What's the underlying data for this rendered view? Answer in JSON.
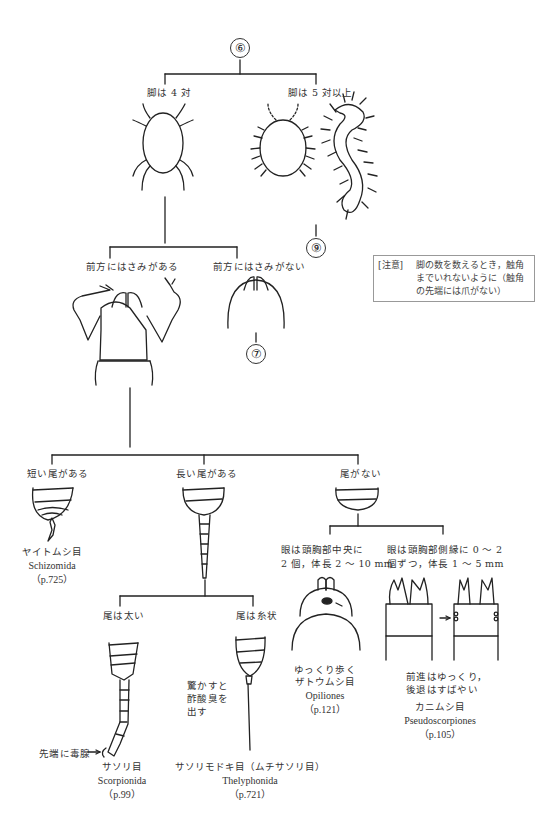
{
  "nodes": {
    "start": "⑥",
    "goto_7": "⑦",
    "goto_9": "⑨"
  },
  "legs": {
    "four_pairs": "脚は 4 対",
    "five_plus_pairs": "脚は 5 対以上"
  },
  "note": {
    "tag": "[注意]",
    "text": "脚の数を数えるとき，触角までいれないように（触角の先端には爪がない）"
  },
  "front": {
    "with_pincers": "前方にはさみがある",
    "without_pincers": "前方にはさみがない"
  },
  "tail": {
    "short": "短い尾がある",
    "long": "長い尾がある",
    "none": "尾がない",
    "thick": "尾は太い",
    "threadlike": "尾は糸状"
  },
  "eyes": {
    "center_line1": "眼は頭胸部中央に",
    "center_line2": "2 個，体長 2 〜 10 mm",
    "side_line1": "眼は頭胸部側縁に 0 〜 2",
    "side_line2": "個ずつ，体長 1 〜 5 mm"
  },
  "annotations": {
    "stinger": "先端に毒腺",
    "vinegar_line1": "驚かすと",
    "vinegar_line2": "酢酸臭を",
    "vinegar_line3": "出す",
    "slow_walk": "ゆっくり歩く",
    "pseudo_line1": "前進はゆっくり，",
    "pseudo_line2": "後退はすばやい"
  },
  "taxa": [
    {
      "jp": "ヤイトムシ目",
      "sci": "Schizomida",
      "page": "（p.725）"
    },
    {
      "jp": "サソリ目",
      "sci": "Scorpionida",
      "page": "（p.99）"
    },
    {
      "jp": "サソリモドキ目（ムチサソリ目）",
      "sci": "Thelyphonida",
      "page": "（p.721）"
    },
    {
      "jp": "ザトウムシ目",
      "sci": "Opiliones",
      "page": "（p.121）"
    },
    {
      "jp": "カニムシ目",
      "sci": "Pseudoscorpiones",
      "page": "（p.105）"
    }
  ]
}
